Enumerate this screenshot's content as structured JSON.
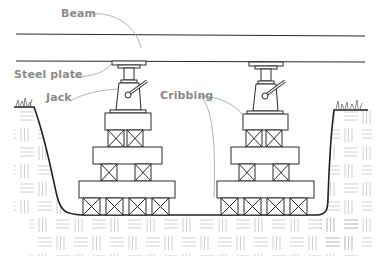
{
  "diagram": {
    "labels": {
      "beam": "Beam",
      "steel_plate": "Steel plate",
      "jack": "Jack",
      "cribbing": "Cribbing"
    },
    "colors": {
      "outline": "#2a2a2a",
      "leader_line": "#9a9a9a",
      "label_text": "#8a8a8a",
      "soil_hatch": "#bdbdbd",
      "background": "#ffffff"
    },
    "components": {
      "jack_count": 2,
      "cribbing_tiers_per_stack": 3,
      "blocks_bottom_row": 4,
      "blocks_middle_row": 2,
      "blocks_top_row": 2
    }
  }
}
